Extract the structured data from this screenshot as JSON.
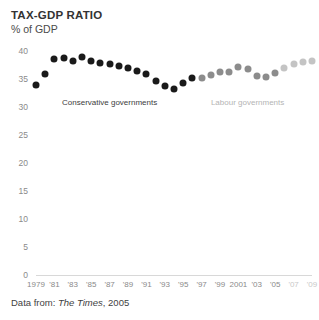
{
  "header": {
    "title": "TAX-GDP RATIO",
    "subtitle": "% of GDP"
  },
  "source": {
    "prefix": "Data from:",
    "publication": "The Times",
    "year": ", 2005"
  },
  "colors": {
    "conservative": "#1a1a1a",
    "labour": "#8c8c8c",
    "projected": "#c4c4c4",
    "axis": "#d8d8d8",
    "tick_text": "#8a8a8a",
    "tick_text_dim": "#c9c9c9"
  },
  "chart_data": {
    "type": "scatter",
    "title": "TAX-GDP RATIO",
    "subtitle": "% of GDP",
    "xlabel": "",
    "ylabel": "% of GDP",
    "ylim": [
      0,
      40
    ],
    "yticks": [
      0,
      5,
      10,
      15,
      20,
      25,
      30,
      35,
      40
    ],
    "ytick_labels": [
      "0",
      "5",
      "10",
      "15",
      "20",
      "25",
      "30",
      "35",
      "40"
    ],
    "xlim": [
      1979,
      2009
    ],
    "xticks": [
      1979,
      1981,
      1983,
      1985,
      1987,
      1989,
      1991,
      1993,
      1995,
      1997,
      1999,
      2001,
      2003,
      2005,
      2007,
      2009
    ],
    "xtick_labels": [
      "1979",
      "'81",
      "'83",
      "'85",
      "'87",
      "'89",
      "'91",
      "'93",
      "'95",
      "'97",
      "'99",
      "2001",
      "'03",
      "'05",
      "'07",
      "'09"
    ],
    "xtick_dim_from": 2007,
    "grid": false,
    "legend_position": "inline-annotations",
    "annotations": [
      {
        "text": "Conservative governments",
        "x": 1987,
        "y": 31.6,
        "series": "conservative"
      },
      {
        "text": "Labour governments",
        "x": 2002,
        "y": 31.6,
        "series": "labour"
      }
    ],
    "x": [
      1979,
      1980,
      1981,
      1982,
      1983,
      1984,
      1985,
      1986,
      1987,
      1988,
      1989,
      1990,
      1991,
      1992,
      1993,
      1994,
      1995,
      1996,
      1997,
      1998,
      1999,
      2000,
      2001,
      2002,
      2003,
      2004,
      2005,
      2006,
      2007,
      2008,
      2009
    ],
    "values": [
      33.9,
      35.9,
      38.6,
      38.7,
      38.2,
      39.0,
      38.2,
      37.8,
      37.6,
      37.4,
      36.9,
      36.4,
      35.9,
      34.7,
      33.7,
      33.2,
      34.3,
      35.1,
      35.2,
      35.8,
      36.2,
      36.2,
      37.2,
      36.8,
      35.6,
      35.4,
      36.0,
      36.9,
      37.7,
      38.0,
      38.3
    ],
    "series": [
      {
        "name": "Conservative governments",
        "color": "#1a1a1a",
        "x": [
          1979,
          1980,
          1981,
          1982,
          1983,
          1984,
          1985,
          1986,
          1987,
          1988,
          1989,
          1990,
          1991,
          1992,
          1993,
          1994,
          1995,
          1996
        ],
        "values": [
          33.9,
          35.9,
          38.6,
          38.7,
          38.2,
          39.0,
          38.2,
          37.8,
          37.6,
          37.4,
          36.9,
          36.4,
          35.9,
          34.7,
          33.7,
          33.2,
          34.3,
          35.1
        ]
      },
      {
        "name": "Labour governments",
        "color": "#8c8c8c",
        "x": [
          1997,
          1998,
          1999,
          2000,
          2001,
          2002,
          2003,
          2004,
          2005
        ],
        "values": [
          35.2,
          35.8,
          36.2,
          36.2,
          37.2,
          36.8,
          35.6,
          35.4,
          36.0
        ]
      },
      {
        "name": "Labour governments projected",
        "color": "#c4c4c4",
        "x": [
          2006,
          2007,
          2008,
          2009
        ],
        "values": [
          36.9,
          37.7,
          38.0,
          38.3
        ]
      }
    ]
  }
}
